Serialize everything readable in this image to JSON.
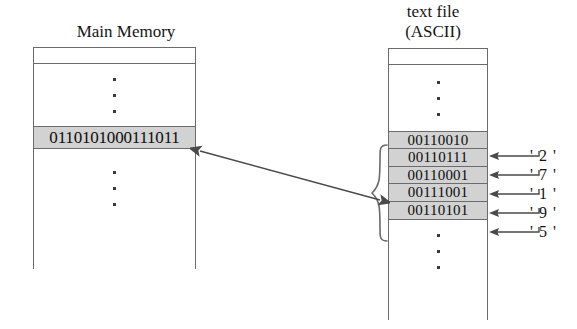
{
  "figure": {
    "main_memory": {
      "title": "Main Memory",
      "word": "0110101000111011",
      "ellipsis_above": "vertical-ellipsis",
      "ellipsis_below": "vertical-ellipsis"
    },
    "text_file": {
      "title_line1": "text file",
      "title_line2": "(ASCII)",
      "ellipsis_above": "vertical-ellipsis",
      "ellipsis_below": "vertical-ellipsis",
      "bytes": [
        {
          "bits": "00110010",
          "char": "' 2 '"
        },
        {
          "bits": "00110111",
          "char": "' 7 '"
        },
        {
          "bits": "00110001",
          "char": "' 1 '"
        },
        {
          "bits": "00111001",
          "char": "' 9 '"
        },
        {
          "bits": "00110101",
          "char": "' 5 '"
        }
      ]
    },
    "colors": {
      "shaded_cell": "#d2d2d2",
      "border": "#6b6b6b",
      "ink": "#141414",
      "background": "#ffffff"
    }
  }
}
